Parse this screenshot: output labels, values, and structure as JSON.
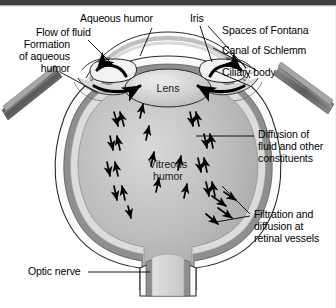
{
  "figure": {
    "background_color": "#ffffff",
    "top_bar_color": "#3f3f42"
  },
  "labels": {
    "formation_of_aqueous_humor": "Formation\nof aqueous\nhumor",
    "flow_of_fluid": "Flow of fluid",
    "aqueous_humor": "Aqueous humor",
    "iris": "Iris",
    "spaces_of_fontana": "Spaces of Fontana",
    "canal_of_schlemm": "Canal of Schlemm",
    "ciliary_body": "Ciliary body",
    "diffusion_of_fluid": "Diffusion of\nfluid and other\nconstituents",
    "filtration_and_diffusion": "Filtration and\ndiffusion at\nretinal vessels",
    "optic_nerve": "Optic nerve"
  },
  "interior_labels": {
    "lens": "Lens",
    "vitreous_humor": "Vitreous\nhumor"
  },
  "colors": {
    "sclera": "#fdfdfd",
    "choroid": "#8c8c8c",
    "retina": "#d2d2d2",
    "vitreous": "#b4b4b4",
    "lens": "#cfcfcf",
    "muscle": "#6e6e6e",
    "outline": "#1a1a1a",
    "arrow": "#000000",
    "leader": "#000000"
  }
}
